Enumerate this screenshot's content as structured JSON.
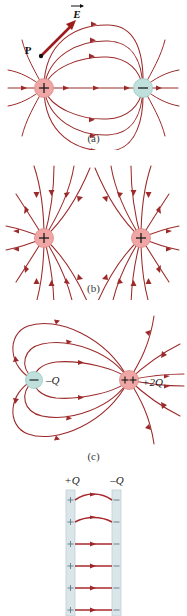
{
  "figure": {
    "colors": {
      "field_line": "#9c2a2a",
      "positive_charge_fill": "#f0a6a4",
      "negative_charge_fill": "#bfe0dc",
      "plate_fill": "#dbe6ea",
      "vector_arrow": "#9e1b1b",
      "background": "#ffffff"
    }
  },
  "panels": [
    {
      "id": "a",
      "caption": "(a)",
      "description": "Electric dipole field lines",
      "labels": {
        "field_vector": "E",
        "point": "P",
        "positive_sign": "+",
        "negative_sign": "−"
      },
      "charges": [
        {
          "sign": "+",
          "name": "positive-charge",
          "label": "+"
        },
        {
          "sign": "−",
          "name": "negative-charge",
          "label": "−"
        }
      ]
    },
    {
      "id": "b",
      "caption": "(b)",
      "description": "Two like positive charges",
      "charges": [
        {
          "sign": "+",
          "name": "positive-charge-left",
          "label": "+"
        },
        {
          "sign": "+",
          "name": "positive-charge-right",
          "label": "+"
        }
      ]
    },
    {
      "id": "c",
      "caption": "(c)",
      "description": "Unequal opposite charges",
      "charges": [
        {
          "sign": "−",
          "name": "negative-charge",
          "label": "−",
          "magnitude_label": "–Q"
        },
        {
          "sign": "++",
          "name": "positive-charge",
          "label": "++",
          "magnitude_label": "+2Q"
        }
      ]
    },
    {
      "id": "d",
      "caption": "",
      "description": "Parallel plate capacitor",
      "plates": [
        {
          "name": "positive-plate",
          "label": "+Q",
          "surface_sign": "+"
        },
        {
          "name": "negative-plate",
          "label": "–Q",
          "surface_sign": "–"
        }
      ]
    }
  ]
}
